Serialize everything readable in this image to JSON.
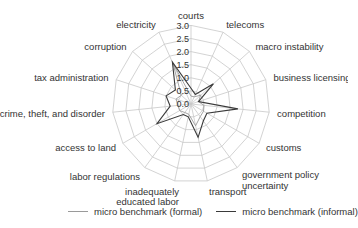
{
  "chart_data": {
    "type": "radar",
    "title": "",
    "categories": [
      "courts",
      "telecoms",
      "macro instability",
      "business licensing",
      "competition",
      "customs",
      "government policy uncertainty",
      "transport",
      "inadequately educated labor",
      "labor regulations",
      "access to land",
      "crime, theft, and disorder",
      "tax administration",
      "corruption",
      "electricity"
    ],
    "label_lines": [
      [
        "courts"
      ],
      [
        "telecoms"
      ],
      [
        "macro instability"
      ],
      [
        "business licensing"
      ],
      [
        "competition"
      ],
      [
        "customs"
      ],
      [
        "government policy",
        "uncertainty"
      ],
      [
        "transport"
      ],
      [
        "inadequately",
        "educated labor"
      ],
      [
        "labor regulations"
      ],
      [
        "access to land"
      ],
      [
        "crime, theft, and disorder"
      ],
      [
        "tax administration"
      ],
      [
        "corruption"
      ],
      [
        "electricity"
      ]
    ],
    "series": [
      {
        "name": "micro benchmark (formal)",
        "color": "#9a9a9a",
        "values": [
          0.3,
          0.3,
          0.5,
          0.3,
          0.5,
          0.55,
          0.6,
          0.85,
          0.4,
          0.4,
          0.5,
          0.5,
          0.6,
          0.5,
          1.7
        ]
      },
      {
        "name": "micro benchmark (informal)",
        "color": "#3a3a3a",
        "values": [
          0.6,
          0.4,
          1.15,
          0.3,
          1.8,
          0.7,
          0.8,
          1.3,
          0.5,
          0.5,
          1.5,
          0.8,
          1.0,
          0.8,
          1.75
        ]
      }
    ],
    "rlim": [
      0,
      3.0
    ],
    "ticks": [
      "0.0",
      "0.5",
      "1.0",
      "1.5",
      "2.0",
      "2.5",
      "3.0"
    ],
    "grid": true,
    "legend_position": "bottom"
  },
  "legend": {
    "formal_label": "micro benchmark (formal)",
    "informal_label": "micro benchmark (informal)",
    "formal_color": "#9a9a9a",
    "informal_color": "#3a3a3a"
  }
}
